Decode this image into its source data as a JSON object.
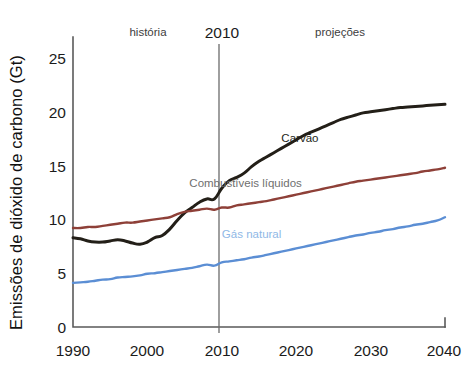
{
  "chart_data": {
    "type": "line",
    "title": "",
    "xlabel": "",
    "ylabel": "Emissões de dióxido de carbono (Gt)",
    "xlim": [
      1990,
      2040
    ],
    "ylim": [
      0,
      27
    ],
    "grid": false,
    "legend_position": "inline-labels",
    "x_ticks": [
      "1990",
      "2000",
      "2010",
      "2020",
      "2030",
      "2040"
    ],
    "y_ticks": [
      "0",
      "5",
      "10",
      "15",
      "20",
      "25"
    ],
    "annotations": [
      {
        "name": "historia",
        "text": "história",
        "x": 1998.5,
        "y": 26.0
      },
      {
        "name": "year-divider",
        "text": "2010",
        "x": 2010,
        "y": 26.4
      },
      {
        "name": "projecoes",
        "text": "projeções",
        "x": 2024.5,
        "y": 26.0
      }
    ],
    "divider_year": 2010,
    "x": [
      1990,
      1991,
      1992,
      1993,
      1994,
      1995,
      1996,
      1997,
      1998,
      1999,
      2000,
      2001,
      2002,
      2003,
      2004,
      2005,
      2006,
      2007,
      2008,
      2009,
      2010,
      2011,
      2012,
      2013,
      2014,
      2015,
      2016,
      2017,
      2018,
      2019,
      2020,
      2021,
      2022,
      2023,
      2024,
      2025,
      2026,
      2027,
      2028,
      2029,
      2030,
      2031,
      2032,
      2033,
      2034,
      2035,
      2036,
      2037,
      2038,
      2039,
      2040
    ],
    "series": [
      {
        "name": "Carvão",
        "label": "Carvão",
        "color": "#231f18",
        "label_color": "#231f18",
        "label_x": 2020.5,
        "label_y": 17.2,
        "values": [
          8.3,
          8.2,
          8.0,
          7.9,
          7.9,
          8.0,
          8.1,
          8.0,
          7.8,
          7.7,
          7.9,
          8.3,
          8.5,
          9.1,
          9.9,
          10.6,
          11.1,
          11.6,
          11.9,
          11.9,
          12.9,
          13.6,
          13.9,
          14.3,
          14.9,
          15.4,
          15.8,
          16.2,
          16.6,
          17.0,
          17.4,
          17.8,
          18.1,
          18.4,
          18.7,
          19.0,
          19.3,
          19.5,
          19.7,
          19.9,
          20.0,
          20.1,
          20.2,
          20.3,
          20.4,
          20.45,
          20.5,
          20.55,
          20.6,
          20.65,
          20.7
        ]
      },
      {
        "name": "Combustíveis líquidos",
        "label": "Combustíveis líquidos",
        "color": "#8e4038",
        "label_color": "#6f6f6f",
        "label_x": 2013.2,
        "label_y": 13.0,
        "values": [
          9.2,
          9.2,
          9.3,
          9.3,
          9.4,
          9.5,
          9.6,
          9.7,
          9.7,
          9.8,
          9.9,
          10.0,
          10.1,
          10.2,
          10.5,
          10.7,
          10.8,
          10.9,
          11.0,
          10.9,
          11.1,
          11.1,
          11.3,
          11.4,
          11.5,
          11.6,
          11.7,
          11.85,
          12.0,
          12.15,
          12.3,
          12.45,
          12.6,
          12.75,
          12.9,
          13.05,
          13.2,
          13.35,
          13.5,
          13.6,
          13.7,
          13.8,
          13.9,
          14.0,
          14.1,
          14.2,
          14.3,
          14.45,
          14.55,
          14.65,
          14.8
        ]
      },
      {
        "name": "Gás natural",
        "label": "Gás natural",
        "color": "#5b8ed4",
        "label_color": "#8fb8e6",
        "label_x": 2014.0,
        "label_y": 8.3,
        "values": [
          4.1,
          4.15,
          4.2,
          4.3,
          4.4,
          4.45,
          4.6,
          4.65,
          4.7,
          4.8,
          4.95,
          5.0,
          5.1,
          5.2,
          5.3,
          5.4,
          5.5,
          5.65,
          5.8,
          5.7,
          6.0,
          6.1,
          6.2,
          6.3,
          6.45,
          6.55,
          6.7,
          6.85,
          7.0,
          7.15,
          7.3,
          7.45,
          7.6,
          7.75,
          7.9,
          8.05,
          8.2,
          8.35,
          8.5,
          8.6,
          8.75,
          8.85,
          9.0,
          9.1,
          9.25,
          9.35,
          9.5,
          9.6,
          9.75,
          9.9,
          10.2
        ]
      }
    ]
  }
}
